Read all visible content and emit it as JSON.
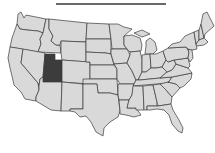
{
  "map": {
    "subject": "United States (contiguous 48 states)",
    "highlighted_state": "Utah",
    "colors": {
      "base_fill": "#d9d9d9",
      "highlight_fill": "#3c3c3c",
      "border": "#3a3a3a",
      "title_rule": "#6a6a6a",
      "background": "#ffffff"
    },
    "states": [
      {
        "id": "WA",
        "name": "Washington",
        "highlighted": false
      },
      {
        "id": "OR",
        "name": "Oregon",
        "highlighted": false
      },
      {
        "id": "CA",
        "name": "California",
        "highlighted": false
      },
      {
        "id": "ID",
        "name": "Idaho",
        "highlighted": false
      },
      {
        "id": "NV",
        "name": "Nevada",
        "highlighted": false
      },
      {
        "id": "UT",
        "name": "Utah",
        "highlighted": true
      },
      {
        "id": "AZ",
        "name": "Arizona",
        "highlighted": false
      },
      {
        "id": "MT",
        "name": "Montana",
        "highlighted": false
      },
      {
        "id": "WY",
        "name": "Wyoming",
        "highlighted": false
      },
      {
        "id": "CO",
        "name": "Colorado",
        "highlighted": false
      },
      {
        "id": "NM",
        "name": "New Mexico",
        "highlighted": false
      },
      {
        "id": "ND",
        "name": "North Dakota",
        "highlighted": false
      },
      {
        "id": "SD",
        "name": "South Dakota",
        "highlighted": false
      },
      {
        "id": "NE",
        "name": "Nebraska",
        "highlighted": false
      },
      {
        "id": "KS",
        "name": "Kansas",
        "highlighted": false
      },
      {
        "id": "OK",
        "name": "Oklahoma",
        "highlighted": false
      },
      {
        "id": "TX",
        "name": "Texas",
        "highlighted": false
      },
      {
        "id": "MN",
        "name": "Minnesota",
        "highlighted": false
      },
      {
        "id": "IA",
        "name": "Iowa",
        "highlighted": false
      },
      {
        "id": "MO",
        "name": "Missouri",
        "highlighted": false
      },
      {
        "id": "AR",
        "name": "Arkansas",
        "highlighted": false
      },
      {
        "id": "LA",
        "name": "Louisiana",
        "highlighted": false
      },
      {
        "id": "WI",
        "name": "Wisconsin",
        "highlighted": false
      },
      {
        "id": "IL",
        "name": "Illinois",
        "highlighted": false
      },
      {
        "id": "MI",
        "name": "Michigan",
        "highlighted": false
      },
      {
        "id": "IN",
        "name": "Indiana",
        "highlighted": false
      },
      {
        "id": "OH",
        "name": "Ohio",
        "highlighted": false
      },
      {
        "id": "KY",
        "name": "Kentucky",
        "highlighted": false
      },
      {
        "id": "TN",
        "name": "Tennessee",
        "highlighted": false
      },
      {
        "id": "MS",
        "name": "Mississippi",
        "highlighted": false
      },
      {
        "id": "AL",
        "name": "Alabama",
        "highlighted": false
      },
      {
        "id": "GA",
        "name": "Georgia",
        "highlighted": false
      },
      {
        "id": "FL",
        "name": "Florida",
        "highlighted": false
      },
      {
        "id": "SC",
        "name": "South Carolina",
        "highlighted": false
      },
      {
        "id": "NC",
        "name": "North Carolina",
        "highlighted": false
      },
      {
        "id": "VA",
        "name": "Virginia",
        "highlighted": false
      },
      {
        "id": "WV",
        "name": "West Virginia",
        "highlighted": false
      },
      {
        "id": "PA",
        "name": "Pennsylvania",
        "highlighted": false
      },
      {
        "id": "NY",
        "name": "New York",
        "highlighted": false
      },
      {
        "id": "VT",
        "name": "Vermont",
        "highlighted": false
      },
      {
        "id": "NH",
        "name": "New Hampshire",
        "highlighted": false
      },
      {
        "id": "ME",
        "name": "Maine",
        "highlighted": false
      },
      {
        "id": "MA",
        "name": "Massachusetts",
        "highlighted": false
      },
      {
        "id": "NJ",
        "name": "New Jersey",
        "highlighted": false
      },
      {
        "id": "MD",
        "name": "Maryland",
        "highlighted": false
      }
    ]
  }
}
